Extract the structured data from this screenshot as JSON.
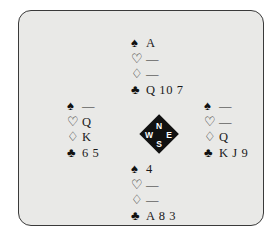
{
  "diagram": {
    "type": "bridge-hand-diagram",
    "panel": {
      "background_color": "#e9e9e7",
      "border_color": "#3a3a3a",
      "page_background": "#ffffff"
    },
    "suit_symbols": {
      "spade": "♠",
      "heart": "♡",
      "diamond": "♢",
      "club": "♣"
    },
    "void_mark": "—",
    "compass": {
      "north": "N",
      "west": "W",
      "east": "E",
      "south": "S",
      "fill_color": "#111111",
      "label_color": "#ffffff"
    },
    "hands": {
      "north": {
        "position": "North",
        "spades": "A",
        "hearts": "—",
        "diamonds": "—",
        "clubs": "Q 10 7"
      },
      "west": {
        "position": "West",
        "spades": "—",
        "hearts": "Q",
        "diamonds": "K",
        "clubs": "6 5"
      },
      "east": {
        "position": "East",
        "spades": "—",
        "hearts": "—",
        "diamonds": "Q",
        "clubs": "K J 9"
      },
      "south": {
        "position": "South",
        "spades": "4",
        "hearts": "—",
        "diamonds": "—",
        "clubs": "A 8 3"
      }
    }
  }
}
